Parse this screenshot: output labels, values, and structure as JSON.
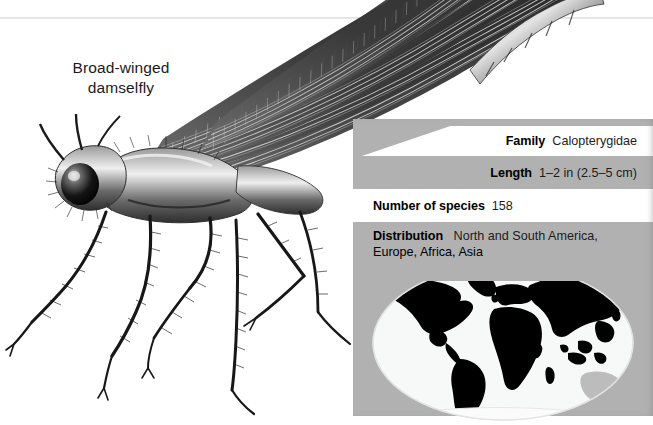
{
  "figure": {
    "caption_line1": "Broad-winged",
    "caption_line2": "damselfly",
    "subject_icon": "damselfly-illustration",
    "colors": {
      "panel_gray": "#b1b1b1",
      "panel_white": "#ffffff",
      "land_highlight": "#000000",
      "land_unhighlighted": "#b9b9b9",
      "ocean": "#f6f7f7",
      "text": "#000000"
    }
  },
  "fact_panel": {
    "rows": [
      {
        "label": "Family",
        "value": "Calopterygidae"
      },
      {
        "label": "Length",
        "value": "1–2 in (2.5–5 cm)"
      },
      {
        "label": "Number of species",
        "value": "158"
      },
      {
        "label": "Distribution",
        "value_line1": "North and South America,",
        "value_line2": "Europe, Africa, Asia"
      }
    ]
  },
  "map": {
    "icon": "world-distribution-map",
    "projection": "elliptical",
    "highlighted_regions": [
      "North America",
      "South America",
      "Europe",
      "Africa",
      "Asia"
    ],
    "unhighlighted_regions": [
      "Australia",
      "Antarctica"
    ]
  }
}
